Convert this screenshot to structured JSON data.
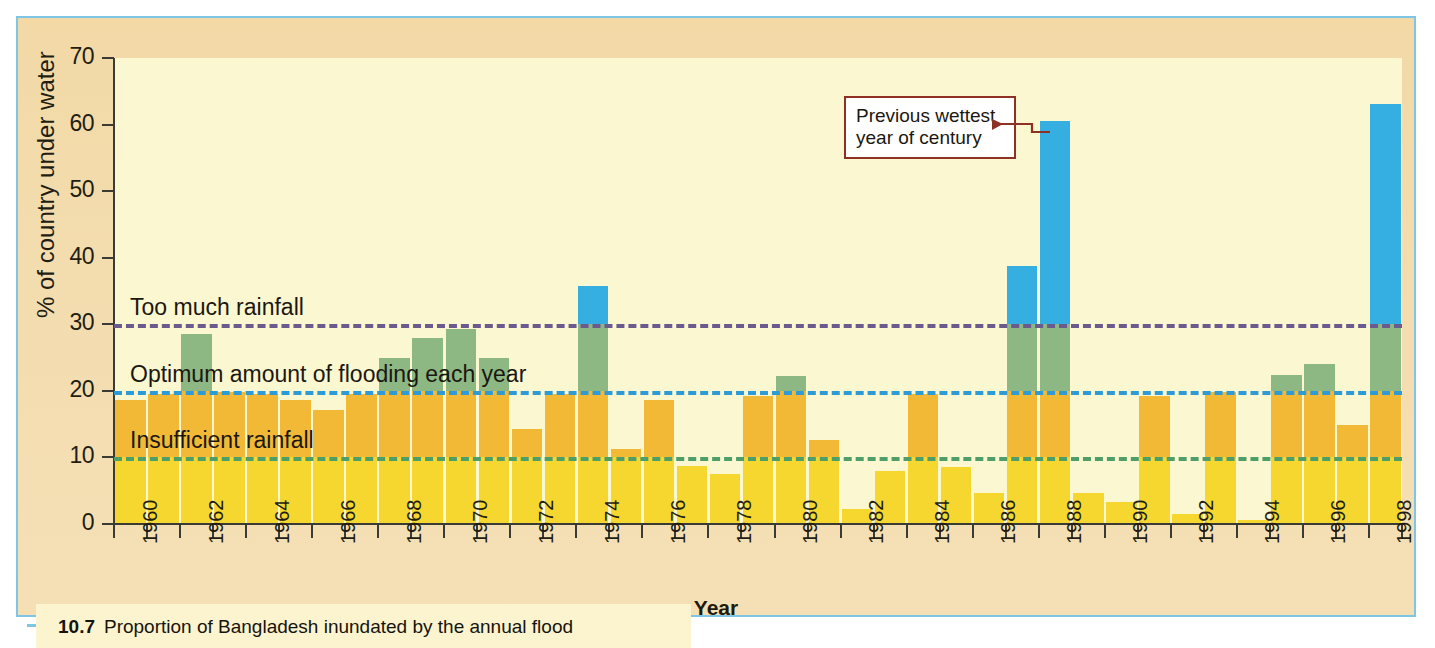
{
  "figure": {
    "caption_number": "10.7",
    "caption_text": "Proportion of Bangladesh inundated by the annual flood"
  },
  "annotation": {
    "line1": "Previous wettest",
    "line2": "year of century",
    "border_color": "#8e3024",
    "points_to_year": 1987
  },
  "colors": {
    "band_insufficient": "#F5D730",
    "band_below_optimum": "#F2B937",
    "band_optimum": "#8DB884",
    "band_too_much": "#35AEE2",
    "plot_background": "#FBF7D1",
    "panel_background": "#F3DCAE",
    "frame": "#7FC6E6",
    "axis": "#3B3B36",
    "threshold_10": "#4E9E6A",
    "threshold_20": "#2E9BD6",
    "threshold_30": "#6B5A8E"
  },
  "chart_data": {
    "type": "bar",
    "title": "Proportion of Bangladesh inundated by the annual flood",
    "xlabel": "Year",
    "ylabel": "% of country under water",
    "ylim": [
      0,
      70
    ],
    "ytick_values": [
      0,
      10,
      20,
      30,
      40,
      50,
      60,
      70
    ],
    "ytick_labels": [
      "0",
      "10",
      "20",
      "30",
      "40",
      "50",
      "60",
      "70"
    ],
    "xlim": [
      1959.5,
      1998.5
    ],
    "xtick_labels": [
      "1960",
      "1962",
      "1964",
      "1966",
      "1968",
      "1970",
      "1972",
      "1974",
      "1976",
      "1978",
      "1980",
      "1982",
      "1984",
      "1986",
      "1988",
      "1990",
      "1992",
      "1994",
      "1996",
      "1998"
    ],
    "grid": false,
    "legend": "none",
    "thresholds": [
      {
        "value": 10,
        "label": "Insufficient rainfall",
        "color": "#4E9E6A",
        "label_x_px": 112,
        "label_dy_px": -30
      },
      {
        "value": 20,
        "label": "Optimum amount of flooding each year",
        "color": "#2E9BD6",
        "label_x_px": 112,
        "label_dy_px": -30
      },
      {
        "value": 30,
        "label": "Too much rainfall",
        "color": "#6B5A8E",
        "label_x_px": 112,
        "label_dy_px": -30
      }
    ],
    "categories": [
      1960,
      1961,
      1962,
      1963,
      1964,
      1965,
      1966,
      1967,
      1968,
      1969,
      1970,
      1971,
      1972,
      1973,
      1974,
      1975,
      1976,
      1977,
      1978,
      1979,
      1980,
      1981,
      1982,
      1983,
      1984,
      1985,
      1986,
      1987,
      1988,
      1989,
      1990,
      1991,
      1992,
      1993,
      1994,
      1995,
      1996,
      1997,
      1998
    ],
    "values": [
      18.6,
      19.6,
      28.5,
      19.8,
      19.6,
      18.6,
      17.1,
      19.6,
      24.9,
      27.9,
      29.3,
      25.0,
      14.3,
      19.6,
      35.8,
      11.2,
      18.7,
      8.7,
      7.5,
      19.2,
      22.3,
      12.6,
      2.3,
      8.0,
      19.5,
      8.6,
      4.6,
      38.7,
      60.5,
      4.6,
      3.3,
      19.3,
      1.5,
      19.8,
      0.6,
      22.4,
      24.0,
      14.8,
      63.1
    ]
  }
}
